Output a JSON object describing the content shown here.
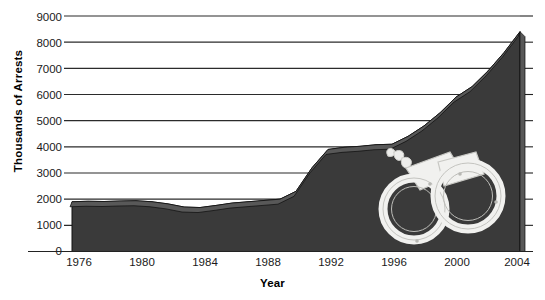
{
  "chart_data": {
    "type": "area",
    "title": "",
    "xlabel": "Year",
    "ylabel": "Thousands of Arrests",
    "xlim": [
      1976,
      2004
    ],
    "ylim": [
      0,
      9000
    ],
    "ytick_labels": [
      "0",
      "1000",
      "2000",
      "3000",
      "4000",
      "5000",
      "6000",
      "7000",
      "8000",
      "9000"
    ],
    "ytick_values": [
      0,
      1000,
      2000,
      3000,
      4000,
      5000,
      6000,
      7000,
      8000,
      9000
    ],
    "xtick_labels": [
      "1976",
      "1980",
      "1984",
      "1988",
      "1992",
      "1996",
      "2000",
      "2004"
    ],
    "xtick_values": [
      1976,
      1980,
      1984,
      1988,
      1992,
      1996,
      2000,
      2004
    ],
    "grid": true,
    "legend": "none",
    "series": [
      {
        "name": "Arrests",
        "x": [
          1976,
          1977,
          1978,
          1979,
          1980,
          1981,
          1982,
          1983,
          1984,
          1985,
          1986,
          1987,
          1988,
          1989,
          1990,
          1991,
          1992,
          1993,
          1994,
          1995,
          1996,
          1997,
          1998,
          1999,
          2000,
          2001,
          2002,
          2003,
          2004
        ],
        "values": [
          1900,
          1920,
          1910,
          1930,
          1940,
          1900,
          1820,
          1700,
          1680,
          1760,
          1850,
          1900,
          1950,
          2000,
          2300,
          3200,
          3900,
          3980,
          4020,
          4080,
          4100,
          4400,
          4800,
          5300,
          5900,
          6300,
          6900,
          7600,
          8400
        ]
      }
    ],
    "annotation_icon": "handcuffs-illustration",
    "colors": {
      "area_fill": "#3a3a3a",
      "area_bevel": "#585858",
      "grid": "#2b2b2b",
      "text": "#111111",
      "background": "#ffffff"
    }
  }
}
